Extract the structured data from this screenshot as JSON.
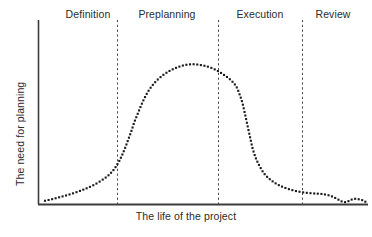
{
  "chart_data": {
    "type": "line",
    "title": "",
    "subtitle": "",
    "xlabel": "The life of the project",
    "ylabel": "The need for planning",
    "grid": false,
    "legend": null,
    "axis_style": "dotted-curve-with-phase-dividers",
    "xlim": [
      0,
      100
    ],
    "ylim": [
      0,
      100
    ],
    "x_ticks": [],
    "y_ticks": [],
    "series": [
      {
        "name": "The need for planning",
        "marker": "square-dot",
        "line_style": "dotted",
        "color": "#1a1a1a",
        "x": [
          1.8,
          4.0,
          6.2,
          8.4,
          10.6,
          12.8,
          15.0,
          17.2,
          19.4,
          21.0,
          22.6,
          23.6,
          24.6,
          25.5,
          26.4,
          27.3,
          28.2,
          29.0,
          30.0,
          31.0,
          32.0,
          33.2,
          34.6,
          36.2,
          38.0,
          40.0,
          42.2,
          44.6,
          47.0,
          49.4,
          51.8,
          54.0,
          56.0,
          58.0,
          59.8,
          60.8,
          61.8,
          62.6,
          63.4,
          64.2,
          65.0,
          66.0,
          67.2,
          68.4,
          69.8,
          71.4,
          73.2,
          75.4,
          77.8,
          80.4,
          83.2,
          86.0,
          88.4,
          90.4,
          92.0,
          93.4,
          94.6,
          95.8,
          97.0,
          98.2,
          99.2
        ],
        "y": [
          2.0,
          3.0,
          4.2,
          5.4,
          6.8,
          8.4,
          10.2,
          12.4,
          15.2,
          17.6,
          21.0,
          24.0,
          27.5,
          31.5,
          36.0,
          41.0,
          46.0,
          51.0,
          56.0,
          61.0,
          65.5,
          70.0,
          74.0,
          77.5,
          80.5,
          83.0,
          85.0,
          86.4,
          86.8,
          86.2,
          85.0,
          83.0,
          80.5,
          77.5,
          73.5,
          69.0,
          63.0,
          56.0,
          48.5,
          41.0,
          34.0,
          28.0,
          23.0,
          19.0,
          16.0,
          13.5,
          11.4,
          9.6,
          8.2,
          7.2,
          6.6,
          6.2,
          5.2,
          3.4,
          1.6,
          1.2,
          2.4,
          3.2,
          3.0,
          2.4,
          1.4
        ],
        "description": "Bell-shaped dotted curve: low through Definition, steep rise into Preplanning, peak mid-Preplanning, steep drop at start of Execution, long low tail through Execution, small bump in Review."
      }
    ],
    "annotations": {
      "peak": {
        "x": 47.0,
        "y": 86.8,
        "phase": "Preplanning"
      },
      "start": {
        "x": 1.8,
        "y": 2.0
      },
      "end": {
        "x": 99.2,
        "y": 1.4
      }
    },
    "phases": [
      {
        "label": "Definition",
        "x_start": 0.0,
        "x_end": 23.6,
        "label_x": 15.2
      },
      {
        "label": "Preplanning",
        "x_start": 23.6,
        "x_end": 54.5,
        "label_x": 39.0
      },
      {
        "label": "Execution",
        "x_start": 54.5,
        "x_end": 80.0,
        "label_x": 67.3
      },
      {
        "label": "Review",
        "x_start": 80.0,
        "x_end": 100.0,
        "label_x": 89.5
      }
    ],
    "dividers": [
      {
        "after_phase": "Definition",
        "x": 23.6
      },
      {
        "after_phase": "Preplanning",
        "x": 54.5
      },
      {
        "after_phase": "Execution",
        "x": 80.0
      }
    ],
    "colors": {
      "curve": "#1a1a1a",
      "axis": "#3c3c3c",
      "divider": "#4a4a4a",
      "text": "#2b2b2b",
      "background": "#ffffff"
    }
  }
}
